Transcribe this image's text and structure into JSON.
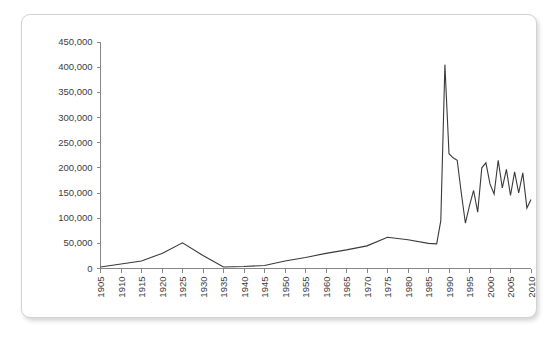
{
  "chart_data": {
    "type": "line",
    "title": "",
    "subtitle": "",
    "xlabel": "",
    "ylabel": "",
    "xlim": [
      1905,
      2010
    ],
    "ylim": [
      0,
      450000
    ],
    "grid": false,
    "legend": null,
    "legend_position": "none",
    "x_tick_labels": [
      "1905",
      "1910",
      "1915",
      "1920",
      "1925",
      "1930",
      "1935",
      "1940",
      "1945",
      "1950",
      "1955",
      "1960",
      "1965",
      "1970",
      "1975",
      "1980",
      "1985",
      "1990",
      "1995",
      "2000",
      "2005",
      "2010"
    ],
    "x_tick_values": [
      1905,
      1910,
      1915,
      1920,
      1925,
      1930,
      1935,
      1940,
      1945,
      1950,
      1955,
      1960,
      1965,
      1970,
      1975,
      1980,
      1985,
      1990,
      1995,
      2000,
      2005,
      2010
    ],
    "y_tick_labels": [
      "0",
      "50,000",
      "100,000",
      "150,000",
      "200,000",
      "250,000",
      "300,000",
      "350,000",
      "400,000",
      "450,000"
    ],
    "y_tick_values": [
      0,
      50000,
      100000,
      150000,
      200000,
      250000,
      300000,
      350000,
      400000,
      450000
    ],
    "series": [
      {
        "name": "",
        "color": "#3a3a3a",
        "x": [
          1905,
          1910,
          1915,
          1920,
          1925,
          1930,
          1935,
          1940,
          1945,
          1950,
          1955,
          1960,
          1965,
          1970,
          1975,
          1980,
          1985,
          1987,
          1988,
          1989,
          1990,
          1991,
          1992,
          1993,
          1994,
          1995,
          1996,
          1997,
          1998,
          1999,
          2000,
          2001,
          2002,
          2003,
          2004,
          2005,
          2006,
          2007,
          2008,
          2009,
          2010
        ],
        "values": [
          3000,
          9000,
          15000,
          30000,
          51000,
          26000,
          3000,
          4000,
          6000,
          15000,
          22000,
          30000,
          37000,
          45000,
          62000,
          57000,
          50000,
          49000,
          95000,
          405000,
          228000,
          220000,
          215000,
          150000,
          90000,
          125000,
          155000,
          112000,
          200000,
          210000,
          168000,
          148000,
          215000,
          160000,
          197000,
          145000,
          192000,
          150000,
          190000,
          120000,
          137000
        ]
      }
    ]
  },
  "figure": {
    "border_color": "#d2d2d2",
    "background": "#ffffff",
    "axis_color": "#868686",
    "line_color": "#3a3a3a"
  }
}
